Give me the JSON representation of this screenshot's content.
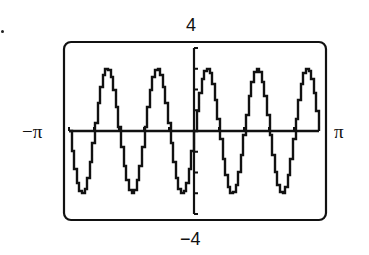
{
  "chart_data": {
    "type": "line",
    "title": "",
    "function": "y = 3 sin(5x)",
    "xlabel": "",
    "ylabel": "",
    "xlim": [
      -3.14159,
      3.14159
    ],
    "ylim": [
      -4,
      4
    ],
    "x_tick_labels": {
      "min": "−π",
      "max": "π"
    },
    "y_tick_labels": {
      "max": "4",
      "min": "−4"
    },
    "y_tick_step": 1,
    "x_tick_step": 0.6283,
    "grid": false,
    "legend": null,
    "series": [
      {
        "name": "graph",
        "amplitude": 3,
        "frequency": 5,
        "phase": 0,
        "samples": 96
      }
    ],
    "style": "graphing calculator screen, pixelated stair-step curve"
  },
  "labels": {
    "top": "4",
    "bottom": "−4",
    "left": "−π",
    "right": "π"
  },
  "colors": {
    "ink": "#111111",
    "background": "#ffffff"
  }
}
